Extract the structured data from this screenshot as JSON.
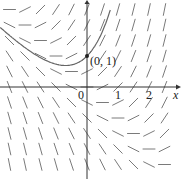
{
  "chart_data": {
    "type": "slope-field",
    "title": "",
    "equation": "dy/dx = x + y",
    "xlabel": "x",
    "ylabel": "",
    "xlim": [
      -2.8,
      3.0
    ],
    "ylim": [
      -2.9,
      2.8
    ],
    "x_ticks": [
      {
        "value": 0,
        "label": "0"
      },
      {
        "value": 1,
        "label": "1"
      },
      {
        "value": 2,
        "label": "2"
      }
    ],
    "grid_x": [
      -2.5,
      -2,
      -1.5,
      -1,
      -0.5,
      0,
      0.5,
      1,
      1.5,
      2,
      2.5
    ],
    "grid_y": [
      -2.5,
      -2,
      -1.5,
      -1,
      -0.5,
      0,
      0.5,
      1,
      1.5,
      2,
      2.5
    ],
    "solution_curve": {
      "initial_point": [
        0,
        1
      ],
      "label": "(0, 1)",
      "formula": "y = 2e^x - x - 1",
      "x_range": [
        -2.8,
        0.75
      ]
    },
    "grid": false
  }
}
